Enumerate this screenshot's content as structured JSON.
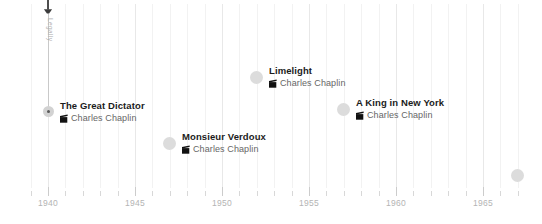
{
  "chart_data": {
    "type": "scatter",
    "title": "",
    "xlabel": "",
    "ylabel": "",
    "xlim": [
      1939,
      1967
    ],
    "tick_labels": [
      "1940",
      "1945",
      "1950",
      "1955",
      "1960",
      "1965"
    ],
    "tick_values": [
      1940,
      1945,
      1950,
      1955,
      1960,
      1965
    ],
    "grid": true,
    "legend": "none",
    "series": [
      {
        "name": "Charles Chaplin films",
        "points": [
          {
            "x": 1940,
            "label": "The Great Dictator",
            "sublabel": "Charles Chaplin"
          },
          {
            "x": 1947,
            "label": "Monsieur Verdoux",
            "sublabel": "Charles Chaplin"
          },
          {
            "x": 1952,
            "label": "Limelight",
            "sublabel": "Charles Chaplin"
          },
          {
            "x": 1957,
            "label": "A King in New York",
            "sublabel": "Charles Chaplin"
          },
          {
            "x": 1967,
            "label": "A Countess from Hong Kong",
            "sublabel": "Charles Chaplin"
          }
        ]
      }
    ]
  },
  "axis": {
    "ticks": [
      {
        "label": "1940",
        "value": 1940
      },
      {
        "label": "1945",
        "value": 1945
      },
      {
        "label": "1950",
        "value": 1950
      },
      {
        "label": "1955",
        "value": 1955
      },
      {
        "label": "1960",
        "value": 1960
      },
      {
        "label": "1965",
        "value": 1965
      }
    ]
  },
  "anchor": {
    "label": "Legally",
    "icon": "map-pin-icon"
  },
  "events": [
    {
      "id": "the-great-dictator",
      "title": "The Great Dictator",
      "sublabel": "Charles Chaplin",
      "icon": "clapperboard-icon",
      "year": 1940,
      "align": "left"
    },
    {
      "id": "monsieur-verdoux",
      "title": "Monsieur Verdoux",
      "sublabel": "Charles Chaplin",
      "icon": "clapperboard-icon",
      "year": 1947,
      "align": "left"
    },
    {
      "id": "limelight",
      "title": "Limelight",
      "sublabel": "Charles Chaplin",
      "icon": "clapperboard-icon",
      "year": 1952,
      "align": "left"
    },
    {
      "id": "a-king-in-new-york",
      "title": "A King in New York",
      "sublabel": "Charles Chaplin",
      "icon": "clapperboard-icon",
      "year": 1957,
      "align": "left"
    },
    {
      "id": "a-countess-from-hong-kong",
      "title": "A Countess from Hong Kong",
      "sublabel": "Charles Chaplin",
      "icon": "clapperboard-icon",
      "year": 1967,
      "align": "right"
    }
  ],
  "colors": {
    "marker": "#dcdcdc",
    "marker_core": "#5a5a5a",
    "title_text": "#1b1b1b",
    "sub_text": "#666666",
    "axis_text": "#b4b4b4",
    "gridline": "#f2f2f2",
    "anchor_line": "#c9c9c9"
  }
}
